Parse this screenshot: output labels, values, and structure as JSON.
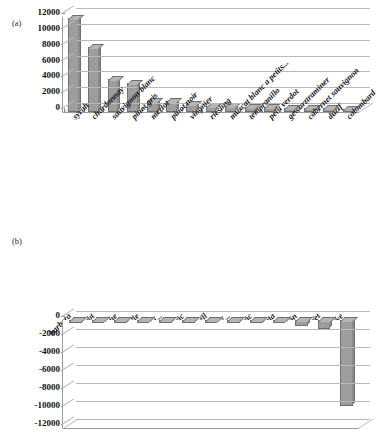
{
  "figure": {
    "panel_a_tag": "(a)",
    "panel_b_tag": "(b)"
  },
  "chart_data": [
    {
      "panel": "(a)",
      "type": "bar",
      "title": "",
      "xlabel": "",
      "ylabel": "",
      "ylim": [
        0,
        12000
      ],
      "yticks": [
        0,
        2000,
        4000,
        6000,
        8000,
        10000,
        12000
      ],
      "ytick_labels": [
        "0",
        "2000",
        "4000",
        "6000",
        "8000",
        "10000",
        "12000"
      ],
      "grid": true,
      "legend": "none",
      "bar_color": "#9d9d9d",
      "categories": [
        "syrah",
        "chardonnay",
        "sauvignon blanc",
        "pinot gris",
        "merlot",
        "pinot noir",
        "viognier",
        "riesling",
        "muscat blanc a petits...",
        "tempranillo",
        "petit verdot",
        "gewurztraminer",
        "cabernet sauvignon",
        "durif",
        "colombard"
      ],
      "values": [
        11900,
        8200,
        4200,
        3700,
        1450,
        1450,
        1050,
        800,
        700,
        650,
        620,
        560,
        520,
        480,
        400
      ]
    },
    {
      "panel": "(b)",
      "type": "bar",
      "title": "",
      "xlabel": "",
      "ylabel": "",
      "ylim": [
        -12000,
        0
      ],
      "yticks": [
        0,
        -2000,
        -4000,
        -6000,
        -8000,
        -10000,
        -12000
      ],
      "ytick_labels": [
        "0",
        "-2000",
        "-4000",
        "-6000",
        "-8000",
        "-10000",
        "-12000"
      ],
      "grid": true,
      "legend": "none",
      "bar_color": "#9d9d9d",
      "categories": [
        "barbera",
        "cot",
        "marsanne",
        "muscadelle",
        "muscat a...",
        "cabernet franc",
        "monastrell",
        "muscat of...",
        "chenin blanc",
        "garnacha tinta",
        "semillon",
        "ruby cabernet",
        "sultaniye"
      ],
      "values": [
        -120,
        -130,
        -140,
        -150,
        -170,
        -190,
        -210,
        -230,
        -260,
        -300,
        -620,
        -1000,
        -9500
      ]
    }
  ]
}
